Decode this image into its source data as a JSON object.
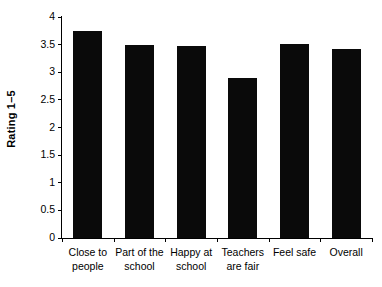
{
  "chart_data": {
    "type": "bar",
    "title": "",
    "subtitle": "",
    "xlabel": "",
    "ylabel": "Rating 1–5",
    "categories": [
      "Close to people",
      "Part of the school",
      "Happy at school",
      "Teachers are fair",
      "Feel safe",
      "Overall"
    ],
    "category_lines": [
      "Close to\npeople",
      "Part of the\nschool",
      "Happy at\nschool",
      "Teachers\nare fair",
      "Feel safe",
      "Overall"
    ],
    "values": [
      3.75,
      3.5,
      3.47,
      2.9,
      3.52,
      3.42
    ],
    "ylim": [
      0,
      4
    ],
    "ytick_values": [
      0,
      0.5,
      1,
      1.5,
      2,
      2.5,
      3,
      3.5,
      4
    ],
    "ytick_labels": [
      "0",
      "0.5",
      "1",
      "1.5",
      "2",
      "2.5",
      "3",
      "3.5",
      "4"
    ],
    "grid": false,
    "legend": false,
    "legend_position": "none",
    "bar_color": "#0a0a0a",
    "background_color": "#ffffff",
    "axis_color": "#000000"
  }
}
